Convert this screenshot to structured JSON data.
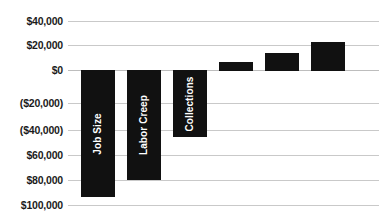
{
  "chart_data": {
    "type": "bar",
    "chart_style": "waterfall",
    "title": "",
    "subtitle": "",
    "xlabel": "",
    "ylabel": "",
    "ylim": [
      -100000,
      40000
    ],
    "y_tick_values": [
      40000,
      20000,
      0,
      -20000,
      -40000,
      -60000,
      -80000,
      -100000
    ],
    "y_tick_labels": [
      "$40,000",
      "$20,000",
      "$0",
      "($20,000)",
      "($40,000)",
      "$60,000",
      "$80,000",
      "$100,000"
    ],
    "grid": true,
    "legend": false,
    "legend_position": "none",
    "categories": [
      "Job Size",
      "Labor Creep",
      "Collections",
      "",
      "",
      ""
    ],
    "values": [
      -94000,
      -80000,
      -46000,
      8000,
      17000,
      30000
    ],
    "bar_color": "#111111",
    "bar_label_color": "#ffffff",
    "gridline_color": "#c9c9c9",
    "background_color": "#ffffff",
    "bars": [
      {
        "label": "Job Size",
        "value": -94000,
        "labeled": true,
        "top_value": 0,
        "bottom_value": -94000
      },
      {
        "label": "Labor Creep",
        "value": -80000,
        "labeled": true,
        "top_value": 0,
        "bottom_value": -80000
      },
      {
        "label": "Collections",
        "value": -46000,
        "labeled": true,
        "top_value": 0,
        "bottom_value": -46000
      },
      {
        "label": "",
        "value": 8000,
        "labeled": false,
        "top_value": 8000,
        "bottom_value": 0
      },
      {
        "label": "",
        "value": 17000,
        "labeled": false,
        "top_value": 17000,
        "bottom_value": 0
      },
      {
        "label": "",
        "value": 30000,
        "labeled": false,
        "top_value": 30000,
        "bottom_value": 0
      }
    ]
  },
  "y_axis": {
    "ticks": [
      {
        "label": "$40,000",
        "y": 21
      },
      {
        "label": "$20,000",
        "y": 45
      },
      {
        "label": "$0",
        "y": 70
      },
      {
        "label": "($20,000)",
        "y": 103
      },
      {
        "label": "($40,000)",
        "y": 130
      },
      {
        "label": "$60,000",
        "y": 155
      },
      {
        "label": "$80,000",
        "y": 180
      },
      {
        "label": "$100,000",
        "y": 205
      }
    ]
  },
  "gridlines": [
    {
      "y": 21
    },
    {
      "y": 45
    },
    {
      "y": 70
    },
    {
      "y": 103
    },
    {
      "y": 130
    },
    {
      "y": 155
    },
    {
      "y": 180
    },
    {
      "y": 205
    }
  ],
  "bar_geometry": [
    {
      "x": 13,
      "y": 70,
      "width": 34,
      "height": 127,
      "label": "Job Size"
    },
    {
      "x": 59,
      "y": 70,
      "width": 34,
      "height": 110,
      "label": "Labor Creep"
    },
    {
      "x": 105,
      "y": 70,
      "width": 34,
      "height": 67,
      "label": "Collections"
    },
    {
      "x": 151,
      "y": 62,
      "width": 34,
      "height": 9,
      "label": ""
    },
    {
      "x": 197,
      "y": 53,
      "width": 34,
      "height": 18,
      "label": ""
    },
    {
      "x": 243,
      "y": 42,
      "width": 34,
      "height": 29,
      "label": ""
    }
  ]
}
